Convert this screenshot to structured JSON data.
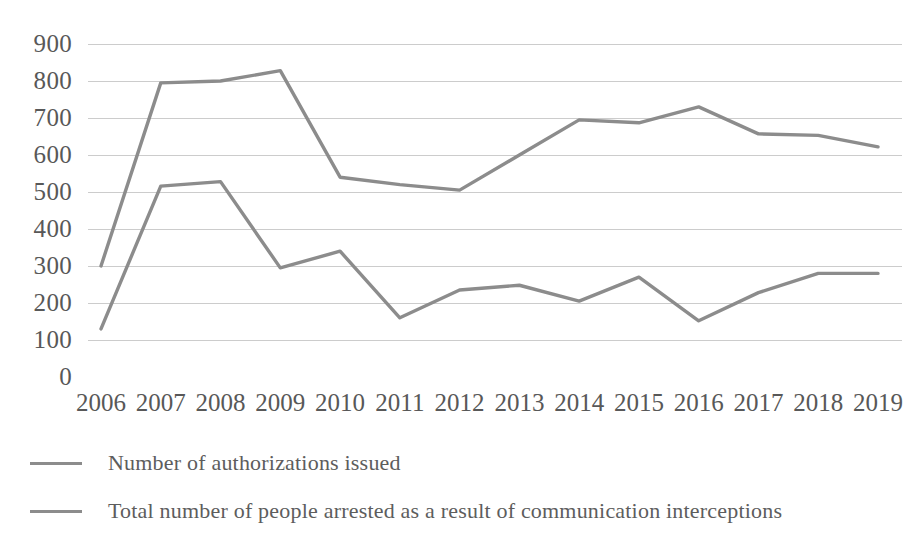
{
  "chart_data": {
    "type": "line",
    "title": "",
    "subtitle": "",
    "xlabel": "",
    "ylabel": "",
    "grid": true,
    "legend_position": "bottom-left",
    "ylim": [
      0,
      900
    ],
    "yticks": [
      900,
      800,
      700,
      600,
      500,
      400,
      300,
      200,
      100,
      0
    ],
    "categories": [
      "2006",
      "2007",
      "2008",
      "2009",
      "2010",
      "2011",
      "2012",
      "2013",
      "2014",
      "2015",
      "2016",
      "2017",
      "2018",
      "2019"
    ],
    "series": [
      {
        "name": "Number of authorizations issued",
        "color": "#8c8c8c",
        "values": [
          300,
          795,
          800,
          828,
          540,
          520,
          505,
          600,
          695,
          687,
          730,
          657,
          653,
          622
        ]
      },
      {
        "name": "Total number of people arrested as a result of communication interceptions",
        "color": "#8c8c8c",
        "values": [
          130,
          516,
          528,
          295,
          340,
          160,
          235,
          248,
          205,
          270,
          152,
          228,
          280,
          280
        ]
      }
    ]
  },
  "axes": {
    "y_ticks": [
      "900",
      "800",
      "700",
      "600",
      "500",
      "400",
      "300",
      "200",
      "100",
      "0"
    ],
    "x_ticks": [
      "2006",
      "2007",
      "2008",
      "2009",
      "2010",
      "2011",
      "2012",
      "2013",
      "2014",
      "2015",
      "2016",
      "2017",
      "2018",
      "2019"
    ]
  },
  "legend": {
    "items": [
      {
        "label": "Number of authorizations issued",
        "swatch": "line-swatch-authorizations"
      },
      {
        "label": "Total number of people arrested as a result of communication interceptions",
        "swatch": "line-swatch-arrested"
      }
    ]
  },
  "colors": {
    "line": "#8c8c8c",
    "gridline": "#b9b9b9",
    "tick_text": "#585858",
    "legend_text": "#5d5d5d",
    "background": "#ffffff"
  }
}
